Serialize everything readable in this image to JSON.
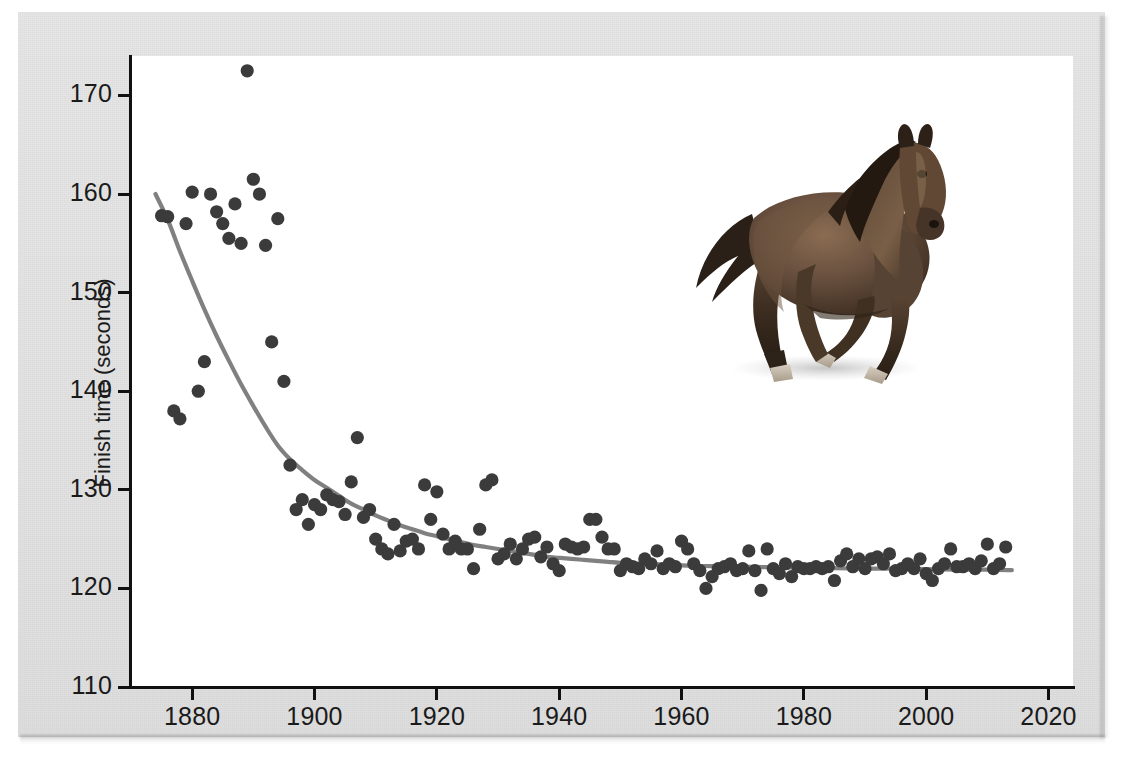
{
  "figure": {
    "background_color": "#e4e4e4",
    "plot_background_color": "#ffffff",
    "point_color": "#3b3b3b",
    "curve_color": "#808080",
    "axis_color": "#111111"
  },
  "illustration": {
    "name": "galloping-horse",
    "alt": "Galloping bay horse",
    "body_color": "#5b4636",
    "mane_color": "#241a12"
  },
  "chart_data": {
    "type": "scatter",
    "title": "",
    "xlabel": "",
    "ylabel": "Finish time (seconds)",
    "xlim": [
      1870,
      2024
    ],
    "ylim": [
      110,
      174
    ],
    "grid": false,
    "legend": null,
    "x_ticks": [
      1880,
      1900,
      1920,
      1940,
      1960,
      1980,
      2000,
      2020
    ],
    "x_tick_labels": [
      "1880",
      "1900",
      "1920",
      "1940",
      "1960",
      "1980",
      "2000",
      "2020"
    ],
    "y_ticks": [
      110,
      120,
      130,
      140,
      150,
      160,
      170
    ],
    "y_tick_labels": [
      "110",
      "120",
      "130",
      "140",
      "150",
      "160",
      "170"
    ],
    "series": [
      {
        "name": "Winning finish time",
        "marker": "circle",
        "color": "#3b3b3b",
        "points": [
          [
            1875,
            157.8
          ],
          [
            1876,
            157.7
          ],
          [
            1877,
            138.0
          ],
          [
            1878,
            137.2
          ],
          [
            1879,
            157.0
          ],
          [
            1880,
            160.2
          ],
          [
            1881,
            140.0
          ],
          [
            1882,
            143.0
          ],
          [
            1883,
            160.0
          ],
          [
            1884,
            158.2
          ],
          [
            1885,
            157.0
          ],
          [
            1886,
            155.5
          ],
          [
            1887,
            159.0
          ],
          [
            1888,
            155.0
          ],
          [
            1889,
            172.5
          ],
          [
            1890,
            161.5
          ],
          [
            1891,
            160.0
          ],
          [
            1892,
            154.8
          ],
          [
            1893,
            145.0
          ],
          [
            1894,
            157.5
          ],
          [
            1895,
            141.0
          ],
          [
            1896,
            132.5
          ],
          [
            1897,
            128.0
          ],
          [
            1898,
            129.0
          ],
          [
            1899,
            126.5
          ],
          [
            1900,
            128.5
          ],
          [
            1901,
            128.0
          ],
          [
            1902,
            129.5
          ],
          [
            1903,
            129.0
          ],
          [
            1904,
            128.8
          ],
          [
            1905,
            127.5
          ],
          [
            1906,
            130.8
          ],
          [
            1907,
            135.3
          ],
          [
            1908,
            127.2
          ],
          [
            1909,
            128.0
          ],
          [
            1910,
            125.0
          ],
          [
            1911,
            124.0
          ],
          [
            1912,
            123.5
          ],
          [
            1913,
            126.5
          ],
          [
            1914,
            123.8
          ],
          [
            1915,
            124.8
          ],
          [
            1916,
            125.0
          ],
          [
            1917,
            124.0
          ],
          [
            1918,
            130.5
          ],
          [
            1919,
            127.0
          ],
          [
            1920,
            129.8
          ],
          [
            1921,
            125.5
          ],
          [
            1922,
            124.0
          ],
          [
            1923,
            124.8
          ],
          [
            1924,
            124.0
          ],
          [
            1925,
            124.0
          ],
          [
            1926,
            122.0
          ],
          [
            1927,
            126.0
          ],
          [
            1928,
            130.5
          ],
          [
            1929,
            131.0
          ],
          [
            1930,
            123.0
          ],
          [
            1931,
            123.5
          ],
          [
            1932,
            124.5
          ],
          [
            1933,
            123.0
          ],
          [
            1934,
            124.0
          ],
          [
            1935,
            125.0
          ],
          [
            1936,
            125.2
          ],
          [
            1937,
            123.2
          ],
          [
            1938,
            124.2
          ],
          [
            1939,
            122.5
          ],
          [
            1940,
            121.8
          ],
          [
            1941,
            124.5
          ],
          [
            1942,
            124.2
          ],
          [
            1943,
            124.0
          ],
          [
            1944,
            124.2
          ],
          [
            1945,
            127.0
          ],
          [
            1946,
            127.0
          ],
          [
            1947,
            125.2
          ],
          [
            1948,
            124.0
          ],
          [
            1949,
            124.0
          ],
          [
            1950,
            121.8
          ],
          [
            1951,
            122.5
          ],
          [
            1952,
            122.2
          ],
          [
            1953,
            122.0
          ],
          [
            1954,
            123.0
          ],
          [
            1955,
            122.5
          ],
          [
            1956,
            123.8
          ],
          [
            1957,
            122.0
          ],
          [
            1958,
            122.5
          ],
          [
            1959,
            122.2
          ],
          [
            1960,
            124.8
          ],
          [
            1961,
            124.0
          ],
          [
            1962,
            122.5
          ],
          [
            1963,
            121.8
          ],
          [
            1964,
            120.0
          ],
          [
            1965,
            121.2
          ],
          [
            1966,
            122.0
          ],
          [
            1967,
            122.2
          ],
          [
            1968,
            122.5
          ],
          [
            1969,
            121.8
          ],
          [
            1970,
            122.0
          ],
          [
            1971,
            123.8
          ],
          [
            1972,
            121.8
          ],
          [
            1973,
            119.8
          ],
          [
            1974,
            124.0
          ],
          [
            1975,
            122.0
          ],
          [
            1976,
            121.5
          ],
          [
            1977,
            122.5
          ],
          [
            1978,
            121.2
          ],
          [
            1979,
            122.2
          ],
          [
            1980,
            122.0
          ],
          [
            1981,
            122.0
          ],
          [
            1982,
            122.2
          ],
          [
            1983,
            122.0
          ],
          [
            1984,
            122.2
          ],
          [
            1985,
            120.8
          ],
          [
            1986,
            122.8
          ],
          [
            1987,
            123.5
          ],
          [
            1988,
            122.2
          ],
          [
            1989,
            123.0
          ],
          [
            1990,
            122.0
          ],
          [
            1991,
            123.0
          ],
          [
            1992,
            123.2
          ],
          [
            1993,
            122.5
          ],
          [
            1994,
            123.5
          ],
          [
            1995,
            121.8
          ],
          [
            1996,
            122.0
          ],
          [
            1997,
            122.5
          ],
          [
            1998,
            122.0
          ],
          [
            1999,
            123.0
          ],
          [
            2000,
            121.5
          ],
          [
            2001,
            120.8
          ],
          [
            2002,
            122.0
          ],
          [
            2003,
            122.5
          ],
          [
            2004,
            124.0
          ],
          [
            2005,
            122.2
          ],
          [
            2006,
            122.2
          ],
          [
            2007,
            122.5
          ],
          [
            2008,
            122.0
          ],
          [
            2009,
            122.8
          ],
          [
            2010,
            124.5
          ],
          [
            2011,
            122.0
          ],
          [
            2012,
            122.5
          ],
          [
            2013,
            124.2
          ]
        ]
      }
    ],
    "fit_curve": {
      "name": "exponential-decay-fit",
      "color": "#808080",
      "points": [
        [
          1874,
          160.0
        ],
        [
          1876,
          157.4
        ],
        [
          1878,
          154.2
        ],
        [
          1880,
          151.2
        ],
        [
          1882,
          148.3
        ],
        [
          1884,
          145.6
        ],
        [
          1886,
          143.1
        ],
        [
          1888,
          140.7
        ],
        [
          1890,
          138.5
        ],
        [
          1892,
          136.4
        ],
        [
          1894,
          134.5
        ],
        [
          1896,
          133.1
        ],
        [
          1898,
          132.0
        ],
        [
          1900,
          131.0
        ],
        [
          1902,
          130.2
        ],
        [
          1904,
          129.4
        ],
        [
          1906,
          128.6
        ],
        [
          1908,
          128.0
        ],
        [
          1910,
          127.4
        ],
        [
          1912,
          126.9
        ],
        [
          1914,
          126.4
        ],
        [
          1916,
          126.0
        ],
        [
          1918,
          125.6
        ],
        [
          1920,
          125.3
        ],
        [
          1922,
          125.0
        ],
        [
          1924,
          124.7
        ],
        [
          1926,
          124.4
        ],
        [
          1928,
          124.2
        ],
        [
          1930,
          124.0
        ],
        [
          1932,
          123.8
        ],
        [
          1934,
          123.6
        ],
        [
          1936,
          123.4
        ],
        [
          1938,
          123.2
        ],
        [
          1940,
          123.1
        ],
        [
          1942,
          123.0
        ],
        [
          1944,
          122.9
        ],
        [
          1946,
          122.8
        ],
        [
          1948,
          122.7
        ],
        [
          1950,
          122.6
        ],
        [
          1954,
          122.5
        ],
        [
          1958,
          122.4
        ],
        [
          1962,
          122.3
        ],
        [
          1966,
          122.25
        ],
        [
          1970,
          122.2
        ],
        [
          1975,
          122.15
        ],
        [
          1980,
          122.1
        ],
        [
          1985,
          122.05
        ],
        [
          1990,
          122.0
        ],
        [
          1995,
          122.0
        ],
        [
          2000,
          121.95
        ],
        [
          2005,
          121.9
        ],
        [
          2010,
          121.9
        ],
        [
          2014,
          121.85
        ]
      ]
    }
  }
}
